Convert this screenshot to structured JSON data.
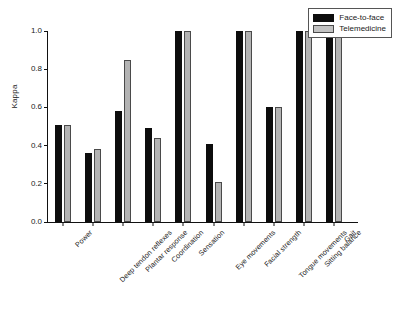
{
  "chart_data": {
    "type": "bar",
    "title": "",
    "xlabel": "",
    "ylabel": "Kappa",
    "ylim": [
      0.0,
      1.0
    ],
    "yticks": [
      "0.0",
      "0.2",
      "0.4",
      "0.6",
      "0.8",
      "1.0"
    ],
    "ytick_values": [
      0.0,
      0.2,
      0.4,
      0.6,
      0.8,
      1.0
    ],
    "grid": false,
    "legend_position": "top-right",
    "categories": [
      "Power",
      "Deep tendon reflexes",
      "Plantar response",
      "Coordination",
      "Sensation",
      "Eye movements",
      "Facial strength",
      "Tongue movements",
      "Sitting balance",
      "Gait"
    ],
    "series": [
      {
        "name": "Face-to-face",
        "color": "#0d0d0d",
        "values": [
          0.51,
          0.36,
          0.58,
          0.49,
          1.0,
          0.41,
          1.0,
          0.6,
          1.0,
          1.0
        ]
      },
      {
        "name": "Telemedicine",
        "color": "#b3b3b3",
        "values": [
          0.51,
          0.38,
          0.85,
          0.44,
          1.0,
          0.21,
          1.0,
          0.6,
          1.0,
          1.0
        ]
      }
    ]
  },
  "legend": {
    "items": [
      {
        "label": "Face-to-face"
      },
      {
        "label": "Telemedicine"
      }
    ]
  }
}
